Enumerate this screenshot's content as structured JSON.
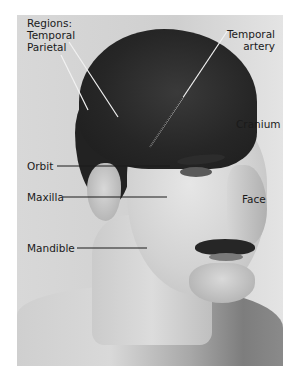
{
  "figure": {
    "labels": {
      "regions_heading": "Regions:",
      "temporal": "Temporal",
      "parietal": "Parietal",
      "temporal_artery_line1": "Temporal",
      "temporal_artery_line2": "artery",
      "cranium": "Cranium",
      "orbit": "Orbit",
      "maxilla": "Maxilla",
      "face": "Face",
      "mandible": "Mandible"
    },
    "colors": {
      "background": "#ffffff",
      "label_text": "#1a1a1a",
      "leader_line_dark": "#1a1a1a",
      "leader_line_light": "#f2f2f2"
    }
  }
}
